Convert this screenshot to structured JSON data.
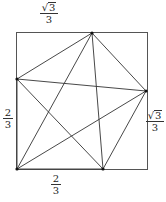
{
  "diagram": {
    "type": "geometry",
    "square": {
      "x1": 16.5,
      "y1": 32.5,
      "x2": 147.5,
      "y2": 169.5,
      "stroke": "#555555"
    },
    "vertices": [
      {
        "id": "top",
        "x": 92,
        "y": 33
      },
      {
        "id": "right",
        "x": 146,
        "y": 91
      },
      {
        "id": "bottom",
        "x": 103,
        "y": 169
      },
      {
        "id": "bottom_left",
        "x": 17,
        "y": 169
      },
      {
        "id": "left",
        "x": 17,
        "y": 79
      }
    ],
    "edges": [
      [
        "top",
        "left"
      ],
      [
        "top",
        "right"
      ],
      [
        "top",
        "bottom_left"
      ],
      [
        "top",
        "bottom"
      ],
      [
        "left",
        "right"
      ],
      [
        "left",
        "bottom"
      ],
      [
        "left",
        "bottom_left"
      ],
      [
        "right",
        "bottom_left"
      ],
      [
        "right",
        "bottom"
      ],
      [
        "bottom_left",
        "bottom"
      ]
    ],
    "line_color": "#333333"
  },
  "labels": {
    "top": {
      "numerator": "3",
      "denominator": "3",
      "radical": true,
      "text": "√3/3"
    },
    "right": {
      "numerator": "3",
      "denominator": "3",
      "radical": true,
      "text": "√3/3"
    },
    "left": {
      "numerator": "2",
      "denominator": "3",
      "radical": false,
      "text": "2/3"
    },
    "bottom": {
      "numerator": "2",
      "denominator": "3",
      "radical": false,
      "text": "2/3"
    }
  }
}
